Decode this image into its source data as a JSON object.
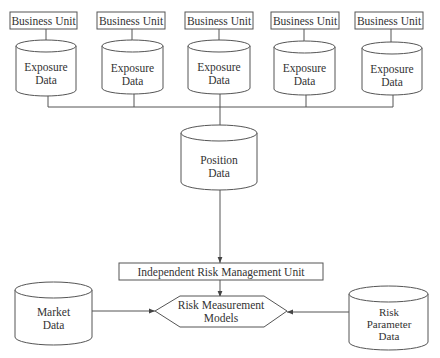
{
  "diagram": {
    "business_units": [
      {
        "label": "Business Unit",
        "store_line1": "Exposure",
        "store_line2": "Data"
      },
      {
        "label": "Business Unit",
        "store_line1": "Exposure",
        "store_line2": "Data"
      },
      {
        "label": "Business Unit",
        "store_line1": "Exposure",
        "store_line2": "Data"
      },
      {
        "label": "Business Unit",
        "store_line1": "Exposure",
        "store_line2": "Data"
      },
      {
        "label": "Business Unit",
        "store_line1": "Exposure",
        "store_line2": "Data"
      }
    ],
    "position_store": {
      "line1": "Position",
      "line2": "Data"
    },
    "risk_unit": {
      "label": "Independent Risk Management Unit"
    },
    "models": {
      "line1": "Risk Measurement",
      "line2": "Models"
    },
    "market_store": {
      "line1": "Market",
      "line2": "Data"
    },
    "parameter_store": {
      "line1": "Risk",
      "line2": "Parameter",
      "line3": "Data"
    },
    "colors": {
      "stroke": "#555555",
      "text": "#333333",
      "background": "#ffffff"
    }
  }
}
